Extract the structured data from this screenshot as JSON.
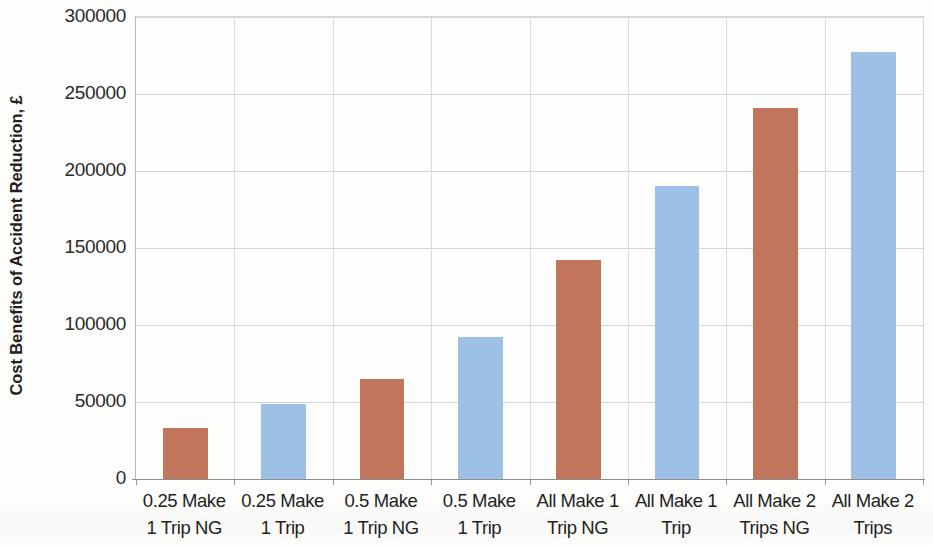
{
  "chart_data": {
    "type": "bar",
    "title": "",
    "xlabel": "",
    "ylabel": "Cost Benefits of Accident Reduction, £",
    "ylim": [
      0,
      300000
    ],
    "ytick_labels": [
      "300000",
      "250000",
      "200000",
      "150000",
      "100000",
      "50000",
      "0"
    ],
    "ytick_values": [
      300000,
      250000,
      200000,
      150000,
      100000,
      50000,
      0
    ],
    "grid": "horizontal-and-vertical",
    "legend": "none",
    "categories": [
      "0.25 Make\n1 Trip NG",
      "0.25 Make\n1 Trip",
      "0.5 Make\n1 Trip NG",
      "0.5 Make\n1 Trip",
      "All Make 1\nTrip NG",
      "All Make 1\nTrip",
      "All Make 2\nTrips NG",
      "All Make 2\nTrips"
    ],
    "values": [
      33000,
      49000,
      65000,
      92000,
      142000,
      190000,
      241000,
      277000
    ],
    "bar_colors": [
      "#c0755c",
      "#9dc0e6",
      "#c0755c",
      "#9dc0e6",
      "#c0755c",
      "#9dc0e6",
      "#c0755c",
      "#9dc0e6"
    ],
    "series_color_red": "#c0755c",
    "series_color_blue": "#9dc0e6"
  }
}
